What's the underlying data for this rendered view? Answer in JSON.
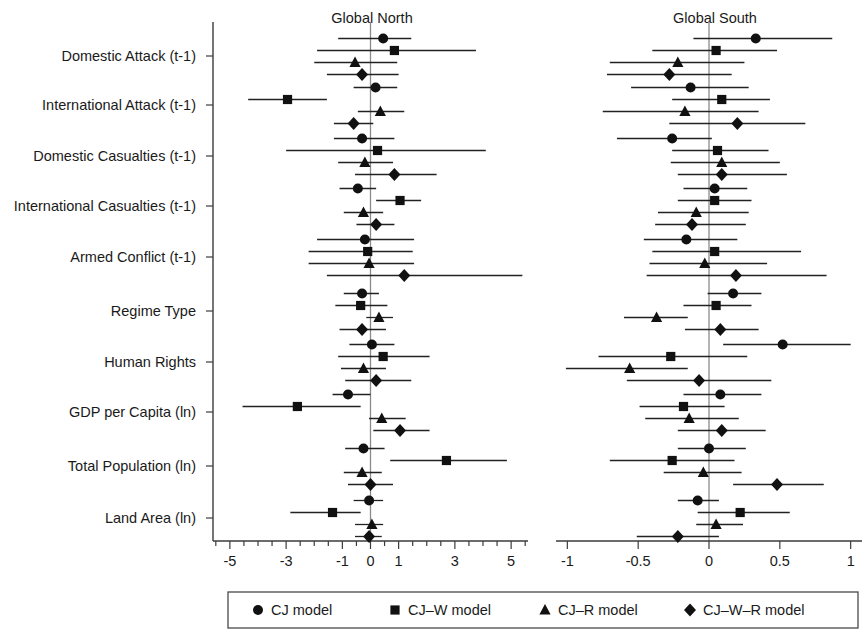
{
  "chart_data": {
    "type": "scatter",
    "title": "",
    "subtitle": "",
    "panels": [
      {
        "name": "north",
        "title": "Global North",
        "xlabel": "",
        "xlim": [
          -5.6,
          5.6
        ],
        "ticks_major": [
          -5,
          -3,
          -1,
          0,
          1,
          3,
          5
        ],
        "tick_labels": [
          "-5",
          "-3",
          "-1",
          "0",
          "1",
          "3",
          "5"
        ],
        "ticks_minor": [
          -5.5,
          -4.5,
          -4,
          -3.5,
          -2.5,
          -2,
          -1.5,
          -0.5,
          0.5,
          1.5,
          2,
          2.5,
          3.5,
          4,
          4.5,
          5.5
        ],
        "grid": false,
        "zero_reference": 0
      },
      {
        "name": "south",
        "title": "Global South",
        "xlabel": "",
        "xlim": [
          -1.08,
          1.08
        ],
        "ticks_major": [
          -1,
          -0.5,
          0,
          0.5,
          1
        ],
        "tick_labels": [
          "-1",
          "-0.5",
          "0",
          "0.5",
          "1"
        ],
        "ticks_minor": [],
        "grid": false,
        "zero_reference": 0
      }
    ],
    "categories": [
      "Domestic Attack (t-1)",
      "International Attack (t-1)",
      "Domestic Casualties (t-1)",
      "International Casualties (t-1)",
      "Armed Conflict (t-1)",
      "Regime Type",
      "Human Rights",
      "GDP per Capita (ln)",
      "Total Population (ln)",
      "Land Area (ln)"
    ],
    "series": [
      {
        "name": "CJ model",
        "marker": "circle"
      },
      {
        "name": "CJ-W model",
        "marker": "square"
      },
      {
        "name": "CJ-R model",
        "marker": "triangle"
      },
      {
        "name": "CJ-W-R model",
        "marker": "diamond"
      }
    ],
    "legend": {
      "position": "bottom",
      "entries": [
        {
          "label": "CJ model",
          "marker": "circle"
        },
        {
          "label": "CJ–W model",
          "marker": "square"
        },
        {
          "label": "CJ–R model",
          "marker": "triangle"
        },
        {
          "label": "CJ–W–R model",
          "marker": "diamond"
        }
      ]
    },
    "north_estimates": [
      {
        "category": "Domestic Attack (t-1)",
        "points": [
          {
            "series": "CJ model",
            "marker": "circle",
            "estimate": 0.45,
            "ci_low": -1.15,
            "ci_high": 1.45
          },
          {
            "series": "CJ-W model",
            "marker": "square",
            "estimate": 0.85,
            "ci_low": -1.9,
            "ci_high": 3.75
          },
          {
            "series": "CJ-R model",
            "marker": "triangle",
            "estimate": -0.55,
            "ci_low": -2.0,
            "ci_high": 0.95
          },
          {
            "series": "CJ-W-R model",
            "marker": "diamond",
            "estimate": -0.3,
            "ci_low": -1.55,
            "ci_high": 1.0
          }
        ]
      },
      {
        "category": "International Attack (t-1)",
        "points": [
          {
            "series": "CJ model",
            "marker": "circle",
            "estimate": 0.18,
            "ci_low": -0.6,
            "ci_high": 0.95
          },
          {
            "series": "CJ-W model",
            "marker": "square",
            "estimate": -2.95,
            "ci_low": -4.35,
            "ci_high": -1.55
          },
          {
            "series": "CJ-R model",
            "marker": "triangle",
            "estimate": 0.35,
            "ci_low": -0.45,
            "ci_high": 1.2
          },
          {
            "series": "CJ-W-R model",
            "marker": "diamond",
            "estimate": -0.6,
            "ci_low": -1.3,
            "ci_high": 0.1
          }
        ]
      },
      {
        "category": "Domestic Casualties (t-1)",
        "points": [
          {
            "series": "CJ model",
            "marker": "circle",
            "estimate": -0.3,
            "ci_low": -1.3,
            "ci_high": 0.85
          },
          {
            "series": "CJ-W model",
            "marker": "square",
            "estimate": 0.25,
            "ci_low": -3.0,
            "ci_high": 4.1
          },
          {
            "series": "CJ-R model",
            "marker": "triangle",
            "estimate": -0.2,
            "ci_low": -1.15,
            "ci_high": 0.8
          },
          {
            "series": "CJ-W-R model",
            "marker": "diamond",
            "estimate": 0.85,
            "ci_low": -0.55,
            "ci_high": 2.35
          }
        ]
      },
      {
        "category": "International Casualties (t-1)",
        "points": [
          {
            "series": "CJ model",
            "marker": "circle",
            "estimate": -0.45,
            "ci_low": -1.1,
            "ci_high": 0.2
          },
          {
            "series": "CJ-W model",
            "marker": "square",
            "estimate": 1.05,
            "ci_low": 0.2,
            "ci_high": 1.8
          },
          {
            "series": "CJ-R model",
            "marker": "triangle",
            "estimate": -0.25,
            "ci_low": -0.95,
            "ci_high": 0.45
          },
          {
            "series": "CJ-W-R model",
            "marker": "diamond",
            "estimate": 0.2,
            "ci_low": -0.5,
            "ci_high": 0.85
          }
        ]
      },
      {
        "category": "Armed Conflict (t-1)",
        "points": [
          {
            "series": "CJ model",
            "marker": "circle",
            "estimate": -0.2,
            "ci_low": -1.9,
            "ci_high": 1.55
          },
          {
            "series": "CJ-W model",
            "marker": "square",
            "estimate": -0.1,
            "ci_low": -2.2,
            "ci_high": 1.5
          },
          {
            "series": "CJ-R model",
            "marker": "triangle",
            "estimate": -0.05,
            "ci_low": -2.2,
            "ci_high": 1.55
          },
          {
            "series": "CJ-W-R model",
            "marker": "diamond",
            "estimate": 1.2,
            "ci_low": -1.55,
            "ci_high": 5.4
          }
        ]
      },
      {
        "category": "Regime Type",
        "points": [
          {
            "series": "CJ model",
            "marker": "circle",
            "estimate": -0.3,
            "ci_low": -0.95,
            "ci_high": 0.3
          },
          {
            "series": "CJ-W model",
            "marker": "square",
            "estimate": -0.35,
            "ci_low": -1.25,
            "ci_high": 0.6
          },
          {
            "series": "CJ-R model",
            "marker": "triangle",
            "estimate": 0.3,
            "ci_low": -0.15,
            "ci_high": 0.8
          },
          {
            "series": "CJ-W-R model",
            "marker": "diamond",
            "estimate": -0.3,
            "ci_low": -1.1,
            "ci_high": 0.55
          }
        ]
      },
      {
        "category": "Human Rights",
        "points": [
          {
            "series": "CJ model",
            "marker": "circle",
            "estimate": 0.05,
            "ci_low": -0.75,
            "ci_high": 0.85
          },
          {
            "series": "CJ-W model",
            "marker": "square",
            "estimate": 0.45,
            "ci_low": -1.15,
            "ci_high": 2.1
          },
          {
            "series": "CJ-R model",
            "marker": "triangle",
            "estimate": -0.25,
            "ci_low": -1.05,
            "ci_high": 0.55
          },
          {
            "series": "CJ-W-R model",
            "marker": "diamond",
            "estimate": 0.2,
            "ci_low": -0.9,
            "ci_high": 1.45
          }
        ]
      },
      {
        "category": "GDP per Capita (ln)",
        "points": [
          {
            "series": "CJ model",
            "marker": "circle",
            "estimate": -0.8,
            "ci_low": -1.35,
            "ci_high": 0.0
          },
          {
            "series": "CJ-W model",
            "marker": "square",
            "estimate": -2.6,
            "ci_low": -4.55,
            "ci_high": -0.35
          },
          {
            "series": "CJ-R model",
            "marker": "triangle",
            "estimate": 0.4,
            "ci_low": -0.05,
            "ci_high": 1.25
          },
          {
            "series": "CJ-W-R model",
            "marker": "diamond",
            "estimate": 1.05,
            "ci_low": 0.1,
            "ci_high": 2.1
          }
        ]
      },
      {
        "category": "Total Population (ln)",
        "points": [
          {
            "series": "CJ model",
            "marker": "circle",
            "estimate": -0.25,
            "ci_low": -0.9,
            "ci_high": 0.5
          },
          {
            "series": "CJ-W model",
            "marker": "square",
            "estimate": 2.7,
            "ci_low": 0.7,
            "ci_high": 4.85
          },
          {
            "series": "CJ-R model",
            "marker": "triangle",
            "estimate": -0.3,
            "ci_low": -0.95,
            "ci_high": 0.4
          },
          {
            "series": "CJ-W-R model",
            "marker": "diamond",
            "estimate": 0.0,
            "ci_low": -0.8,
            "ci_high": 0.8
          }
        ]
      },
      {
        "category": "Land Area (ln)",
        "points": [
          {
            "series": "CJ model",
            "marker": "circle",
            "estimate": -0.05,
            "ci_low": -0.6,
            "ci_high": 0.45
          },
          {
            "series": "CJ-W model",
            "marker": "square",
            "estimate": -1.35,
            "ci_low": -2.85,
            "ci_high": -0.35
          },
          {
            "series": "CJ-R model",
            "marker": "triangle",
            "estimate": 0.05,
            "ci_low": -0.55,
            "ci_high": 0.45
          },
          {
            "series": "CJ-W-R model",
            "marker": "diamond",
            "estimate": -0.05,
            "ci_low": -0.55,
            "ci_high": 0.4
          }
        ]
      }
    ],
    "south_estimates": [
      {
        "category": "Domestic Attack (t-1)",
        "points": [
          {
            "series": "CJ model",
            "marker": "circle",
            "estimate": 0.33,
            "ci_low": -0.11,
            "ci_high": 0.87
          },
          {
            "series": "CJ-W model",
            "marker": "square",
            "estimate": 0.05,
            "ci_low": -0.4,
            "ci_high": 0.48
          },
          {
            "series": "CJ-R model",
            "marker": "triangle",
            "estimate": -0.22,
            "ci_low": -0.7,
            "ci_high": 0.25
          },
          {
            "series": "CJ-W-R model",
            "marker": "diamond",
            "estimate": -0.28,
            "ci_low": -0.72,
            "ci_high": 0.16
          }
        ]
      },
      {
        "category": "International Attack (t-1)",
        "points": [
          {
            "series": "CJ model",
            "marker": "circle",
            "estimate": -0.13,
            "ci_low": -0.55,
            "ci_high": 0.28
          },
          {
            "series": "CJ-W model",
            "marker": "square",
            "estimate": 0.09,
            "ci_low": -0.26,
            "ci_high": 0.43
          },
          {
            "series": "CJ-R model",
            "marker": "triangle",
            "estimate": -0.17,
            "ci_low": -0.75,
            "ci_high": 0.35
          },
          {
            "series": "CJ-W-R model",
            "marker": "diamond",
            "estimate": 0.2,
            "ci_low": -0.28,
            "ci_high": 0.68
          }
        ]
      },
      {
        "category": "Domestic Casualties (t-1)",
        "points": [
          {
            "series": "CJ model",
            "marker": "circle",
            "estimate": -0.26,
            "ci_low": -0.65,
            "ci_high": 0.02
          },
          {
            "series": "CJ-W model",
            "marker": "square",
            "estimate": 0.06,
            "ci_low": -0.26,
            "ci_high": 0.42
          },
          {
            "series": "CJ-R model",
            "marker": "triangle",
            "estimate": 0.09,
            "ci_low": -0.27,
            "ci_high": 0.5
          },
          {
            "series": "CJ-W-R model",
            "marker": "diamond",
            "estimate": 0.09,
            "ci_low": -0.22,
            "ci_high": 0.55
          }
        ]
      },
      {
        "category": "International Casualties (t-1)",
        "points": [
          {
            "series": "CJ model",
            "marker": "circle",
            "estimate": 0.04,
            "ci_low": -0.18,
            "ci_high": 0.27
          },
          {
            "series": "CJ-W model",
            "marker": "square",
            "estimate": 0.04,
            "ci_low": -0.22,
            "ci_high": 0.3
          },
          {
            "series": "CJ-R model",
            "marker": "triangle",
            "estimate": -0.09,
            "ci_low": -0.36,
            "ci_high": 0.28
          },
          {
            "series": "CJ-W-R model",
            "marker": "diamond",
            "estimate": -0.12,
            "ci_low": -0.38,
            "ci_high": 0.26
          }
        ]
      },
      {
        "category": "Armed Conflict (t-1)",
        "points": [
          {
            "series": "CJ model",
            "marker": "circle",
            "estimate": -0.16,
            "ci_low": -0.46,
            "ci_high": 0.2
          },
          {
            "series": "CJ-W model",
            "marker": "square",
            "estimate": 0.04,
            "ci_low": -0.4,
            "ci_high": 0.65
          },
          {
            "series": "CJ-R model",
            "marker": "triangle",
            "estimate": -0.03,
            "ci_low": -0.42,
            "ci_high": 0.41
          },
          {
            "series": "CJ-W-R model",
            "marker": "diamond",
            "estimate": 0.19,
            "ci_low": -0.44,
            "ci_high": 0.83
          }
        ]
      },
      {
        "category": "Regime Type",
        "points": [
          {
            "series": "CJ model",
            "marker": "circle",
            "estimate": 0.17,
            "ci_low": -0.01,
            "ci_high": 0.37
          },
          {
            "series": "CJ-W model",
            "marker": "square",
            "estimate": 0.05,
            "ci_low": -0.18,
            "ci_high": 0.3
          },
          {
            "series": "CJ-R model",
            "marker": "triangle",
            "estimate": -0.37,
            "ci_low": -0.6,
            "ci_high": -0.15
          },
          {
            "series": "CJ-W-R model",
            "marker": "diamond",
            "estimate": 0.08,
            "ci_low": -0.17,
            "ci_high": 0.35
          }
        ]
      },
      {
        "category": "Human Rights",
        "points": [
          {
            "series": "CJ model",
            "marker": "circle",
            "estimate": 0.52,
            "ci_low": 0.1,
            "ci_high": 1.0
          },
          {
            "series": "CJ-W model",
            "marker": "square",
            "estimate": -0.27,
            "ci_low": -0.78,
            "ci_high": 0.27
          },
          {
            "series": "CJ-R model",
            "marker": "triangle",
            "estimate": -0.56,
            "ci_low": -1.01,
            "ci_high": -0.15
          },
          {
            "series": "CJ-W-R model",
            "marker": "diamond",
            "estimate": -0.07,
            "ci_low": -0.58,
            "ci_high": 0.44
          }
        ]
      },
      {
        "category": "GDP per Capita (ln)",
        "points": [
          {
            "series": "CJ model",
            "marker": "circle",
            "estimate": 0.08,
            "ci_low": -0.18,
            "ci_high": 0.37
          },
          {
            "series": "CJ-W model",
            "marker": "square",
            "estimate": -0.18,
            "ci_low": -0.49,
            "ci_high": 0.11
          },
          {
            "series": "CJ-R model",
            "marker": "triangle",
            "estimate": -0.14,
            "ci_low": -0.45,
            "ci_high": 0.21
          },
          {
            "series": "CJ-W-R model",
            "marker": "diamond",
            "estimate": 0.09,
            "ci_low": -0.22,
            "ci_high": 0.4
          }
        ]
      },
      {
        "category": "Total Population (ln)",
        "points": [
          {
            "series": "CJ model",
            "marker": "circle",
            "estimate": 0.0,
            "ci_low": -0.22,
            "ci_high": 0.26
          },
          {
            "series": "CJ-W model",
            "marker": "square",
            "estimate": -0.26,
            "ci_low": -0.7,
            "ci_high": 0.18
          },
          {
            "series": "CJ-R model",
            "marker": "triangle",
            "estimate": -0.04,
            "ci_low": -0.32,
            "ci_high": 0.23
          },
          {
            "series": "CJ-W-R model",
            "marker": "diamond",
            "estimate": 0.48,
            "ci_low": 0.17,
            "ci_high": 0.81
          }
        ]
      },
      {
        "category": "Land Area (ln)",
        "points": [
          {
            "series": "CJ model",
            "marker": "circle",
            "estimate": -0.08,
            "ci_low": -0.22,
            "ci_high": 0.07
          },
          {
            "series": "CJ-W model",
            "marker": "square",
            "estimate": 0.22,
            "ci_low": -0.08,
            "ci_high": 0.57
          },
          {
            "series": "CJ-R model",
            "marker": "triangle",
            "estimate": 0.05,
            "ci_low": -0.09,
            "ci_high": 0.24
          },
          {
            "series": "CJ-W-R model",
            "marker": "diamond",
            "estimate": -0.22,
            "ci_low": -0.51,
            "ci_high": 0.07
          }
        ]
      }
    ]
  }
}
